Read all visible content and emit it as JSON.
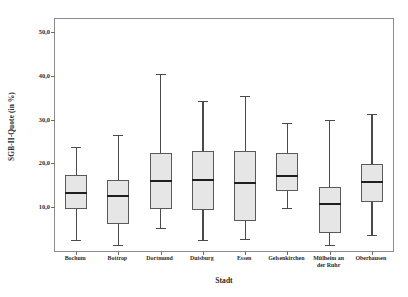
{
  "chart_data": {
    "type": "box",
    "title": "",
    "xlabel": "Stadt",
    "ylabel": "SGB-II-Quote (in %)",
    "ylim": [
      0,
      53
    ],
    "ytick_values": [
      10,
      20,
      30,
      40,
      50
    ],
    "ytick_labels": [
      "10,0",
      "20,0",
      "30,0",
      "40,0",
      "50,0"
    ],
    "grid": false,
    "legend": "none",
    "categories": [
      "Bochum",
      "Bottrop",
      "Dortmund",
      "Duisburg",
      "Essen",
      "Gelsenkirchen",
      "Mülheim an\nder Ruhr",
      "Oberhausen"
    ],
    "boxes": [
      {
        "label": "Bochum",
        "min": 2.5,
        "q1": 9.7,
        "median": 13.2,
        "q3": 17.3,
        "max": 23.7
      },
      {
        "label": "Bottrop",
        "min": 1.3,
        "q1": 6.2,
        "median": 12.5,
        "q3": 16.2,
        "max": 26.5
      },
      {
        "label": "Dortmund",
        "min": 5.3,
        "q1": 9.5,
        "median": 16.0,
        "q3": 22.3,
        "max": 40.5
      },
      {
        "label": "Duisburg",
        "min": 2.5,
        "q1": 9.4,
        "median": 16.2,
        "q3": 22.8,
        "max": 34.2
      },
      {
        "label": "Essen",
        "min": 2.8,
        "q1": 6.8,
        "median": 15.6,
        "q3": 22.8,
        "max": 35.5
      },
      {
        "label": "Gelsenkirchen",
        "min": 9.8,
        "q1": 13.6,
        "median": 17.2,
        "q3": 22.3,
        "max": 29.3
      },
      {
        "label": "Mülheim an der Ruhr",
        "min": 1.3,
        "q1": 4.2,
        "median": 10.7,
        "q3": 14.7,
        "max": 30.0
      },
      {
        "label": "Oberhausen",
        "min": 3.6,
        "q1": 11.2,
        "median": 15.7,
        "q3": 19.8,
        "max": 31.3
      }
    ],
    "colors": {
      "box_fill": "#e6e6e6",
      "box_stroke": "#5a5a5a",
      "median": "#1f1f1f",
      "whisker": "#4a4a4a",
      "frame": "#8c8c8c",
      "text": "#2b2b2b",
      "background": "#ffffff"
    }
  }
}
